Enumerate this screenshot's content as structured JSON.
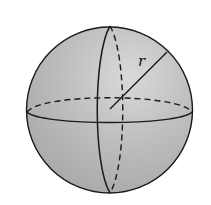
{
  "diagram": {
    "type": "sphere",
    "labels": {
      "radius": "r"
    },
    "colors": {
      "fill": "#b9b9b9",
      "highlight": "#d6d6d6",
      "stroke": "#1a1a1a",
      "background": "#ffffff"
    }
  }
}
